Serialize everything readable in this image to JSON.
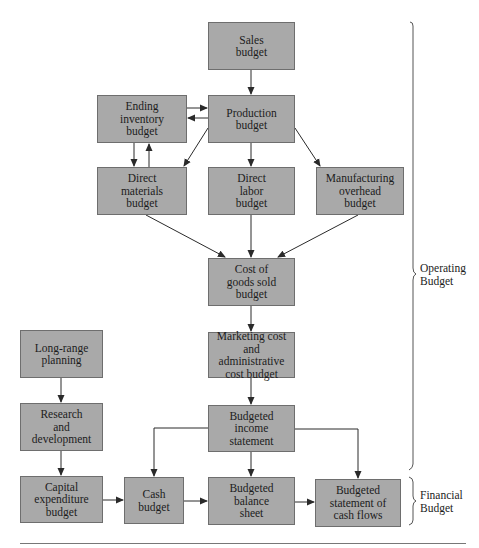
{
  "diagram": {
    "boxes": {
      "sales": "Sales\nbudget",
      "production": "Production\nbudget",
      "ending_inventory": "Ending\ninventory\nbudget",
      "direct_materials": "Direct\nmaterials\nbudget",
      "direct_labor": "Direct\nlabor\nbudget",
      "manufacturing_overhead": "Manufacturing\noverhead\nbudget",
      "cogs": "Cost of\ngoods sold\nbudget",
      "marketing_admin": "Marketing cost\nand administrative\ncost budget",
      "income_statement": "Budgeted\nincome\nstatement",
      "long_range": "Long-range\nplanning",
      "research": "Research\nand\ndevelopment",
      "capital_expenditure": "Capital\nexpenditure\nbudget",
      "cash": "Cash\nbudget",
      "balance_sheet": "Budgeted\nbalance\nsheet",
      "cash_flows": "Budgeted\nstatement of\ncash flows"
    },
    "groups": {
      "operating": "Operating\nBudget",
      "financial": "Financial\nBudget"
    },
    "colors": {
      "box_fill": "#a9a9a9",
      "box_border": "#6e6e6e",
      "line": "#2a2a2a"
    },
    "edges": [
      [
        "sales",
        "production"
      ],
      [
        "ending_inventory",
        "production"
      ],
      [
        "production",
        "ending_inventory"
      ],
      [
        "ending_inventory",
        "direct_materials"
      ],
      [
        "direct_materials",
        "ending_inventory"
      ],
      [
        "production",
        "direct_materials"
      ],
      [
        "production",
        "direct_labor"
      ],
      [
        "production",
        "manufacturing_overhead"
      ],
      [
        "direct_materials",
        "cogs"
      ],
      [
        "direct_labor",
        "cogs"
      ],
      [
        "manufacturing_overhead",
        "cogs"
      ],
      [
        "cogs",
        "marketing_admin"
      ],
      [
        "marketing_admin",
        "income_statement"
      ],
      [
        "income_statement",
        "cash"
      ],
      [
        "income_statement",
        "balance_sheet"
      ],
      [
        "income_statement",
        "cash_flows"
      ],
      [
        "long_range",
        "research"
      ],
      [
        "research",
        "capital_expenditure"
      ],
      [
        "capital_expenditure",
        "cash"
      ],
      [
        "cash",
        "balance_sheet"
      ],
      [
        "balance_sheet",
        "cash_flows"
      ]
    ]
  }
}
